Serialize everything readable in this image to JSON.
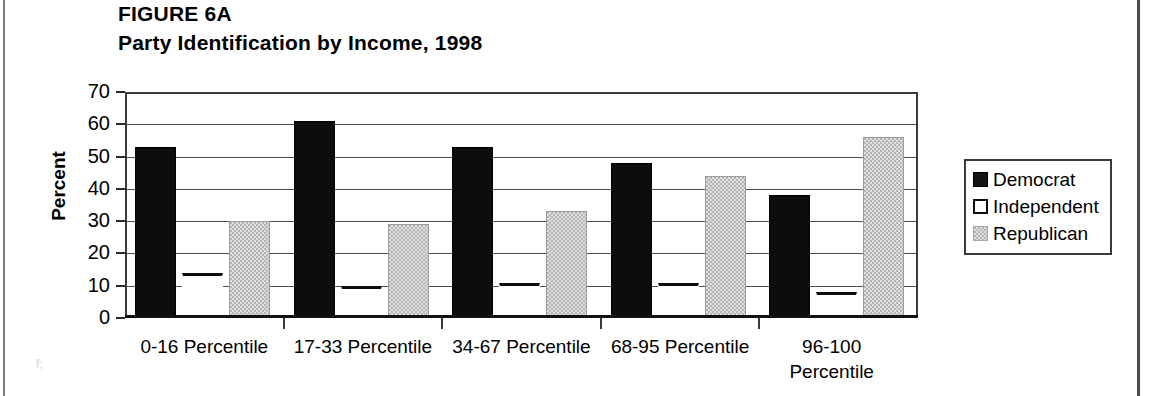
{
  "figure": {
    "title": "FIGURE 6A",
    "subtitle": "Party Identification by Income, 1998"
  },
  "legend": {
    "items": [
      {
        "label": "Democrat",
        "color": "#0d0d0d",
        "swatch": "solid-black"
      },
      {
        "label": "Independent",
        "color": "#ffffff",
        "swatch": "outline-white"
      },
      {
        "label": "Republican",
        "color": "#b5b5b5",
        "swatch": "gray-hatch"
      }
    ]
  },
  "axes": {
    "y_title": "Percent",
    "y_ticks": [
      "70",
      "60",
      "50",
      "40",
      "30",
      "20",
      "10",
      "0"
    ]
  },
  "artifacts": {
    "corner_mark": "f;"
  },
  "chart_data": {
    "type": "bar",
    "title": "Party Identification by Income, 1998",
    "xlabel": "",
    "ylabel": "Percent",
    "ylim": [
      0,
      70
    ],
    "ytick_step": 10,
    "grid": true,
    "legend_position": "right",
    "categories": [
      "0-16 Percentile",
      "17-33 Percentile",
      "34-67 Percentile",
      "68-95 Percentile",
      "96-100 Percentile"
    ],
    "series": [
      {
        "name": "Democrat",
        "color": "#0d0d0d",
        "values": [
          53,
          61,
          53,
          48,
          38
        ]
      },
      {
        "name": "Independent",
        "color": "#ffffff",
        "values": [
          14,
          10,
          11,
          11,
          8
        ]
      },
      {
        "name": "Republican",
        "color": "#b5b5b5",
        "values": [
          30,
          29,
          33,
          44,
          56
        ]
      }
    ]
  }
}
